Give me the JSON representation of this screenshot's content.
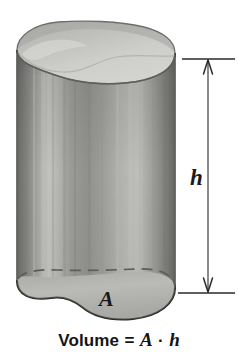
{
  "figure": {
    "kind": "solid-geometry-illustration",
    "canvas": {
      "width": 238,
      "height": 353,
      "background": "#ffffff"
    }
  },
  "labels": {
    "base_area": "A",
    "height": "h"
  },
  "caption": {
    "word_volume": "Volume",
    "equals": "=",
    "var_area": "A",
    "operator": "·",
    "var_height": "h",
    "full_text": "Volume = A · h"
  },
  "dimension": {
    "name": "height-dimension",
    "label": "h",
    "arrow_top": "arrow-up",
    "arrow_bottom": "arrow-down",
    "line_x": 208,
    "top_y": 59,
    "bottom_y": 293
  },
  "solid": {
    "top_face_name": "top-cross-section-face",
    "lateral_face_name": "lateral-surface",
    "bottom_front_edge_name": "bottom-front-edge",
    "bottom_hidden_edge_name": "bottom-hidden-edge-dashed",
    "left_edge_x": 17,
    "right_edge_x": 175,
    "top_y": 22,
    "bottom_y": 320
  },
  "colors": {
    "ink": "#141414",
    "outline": "#2b2b2b",
    "top_face_light": "#e8e8e6",
    "top_face_shade": "#b9b9b6",
    "side_dark": "#5a5a58",
    "side_mid": "#8e8e8b",
    "side_light": "#d9d9d6",
    "background": "#ffffff"
  }
}
